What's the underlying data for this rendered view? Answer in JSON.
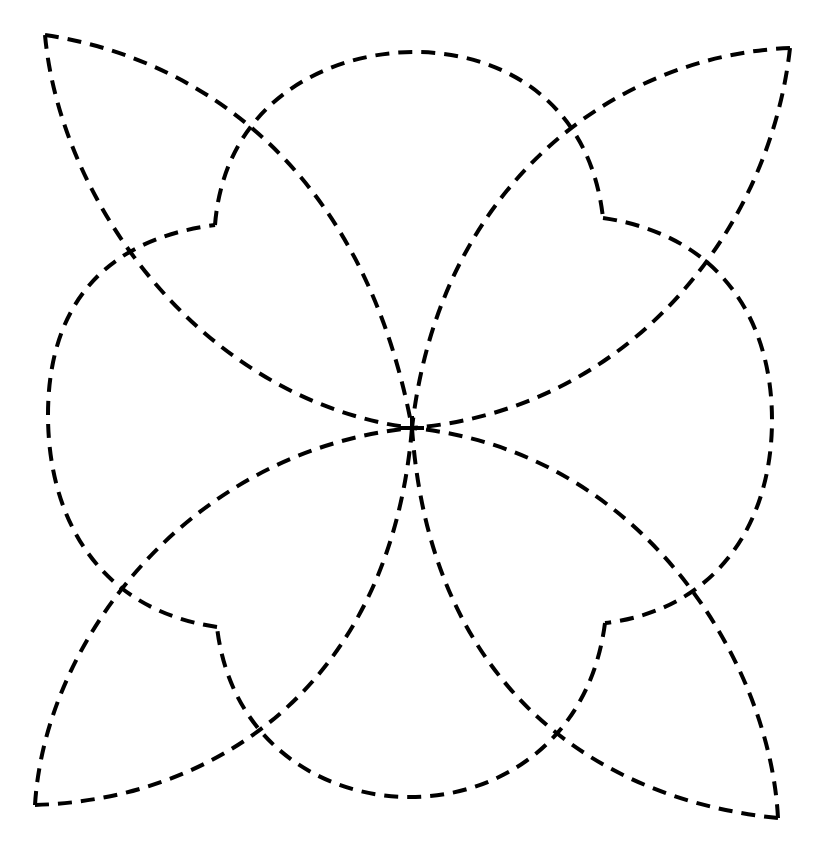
{
  "diagram": {
    "stroke_color": "#000000",
    "background": "#ffffff",
    "center": [
      412,
      428
    ],
    "center_mark": "plus-sign",
    "leaves": [
      {
        "name": "top-left",
        "corner": [
          45,
          35
        ],
        "edge_a_via": [
          268,
          108
        ],
        "edge_b_via": [
          112,
          268
        ]
      },
      {
        "name": "top-right",
        "corner": [
          790,
          48
        ],
        "edge_a_via": [
          565,
          118
        ],
        "edge_b_via": [
          715,
          285
        ]
      },
      {
        "name": "bottom-right",
        "corner": [
          778,
          818
        ],
        "edge_a_via": [
          708,
          578
        ],
        "edge_b_via": [
          552,
          742
        ]
      },
      {
        "name": "bottom-left",
        "corner": [
          35,
          805
        ],
        "edge_a_via": [
          107,
          575
        ],
        "edge_b_via": [
          260,
          735
        ]
      }
    ],
    "ring": {
      "notches": [
        [
          215,
          225
        ],
        [
          603,
          218
        ],
        [
          605,
          623
        ],
        [
          217,
          627
        ]
      ],
      "lobe_peaks": [
        [
          415,
          52
        ],
        [
          772,
          420
        ],
        [
          410,
          797
        ],
        [
          48,
          415
        ]
      ]
    }
  }
}
